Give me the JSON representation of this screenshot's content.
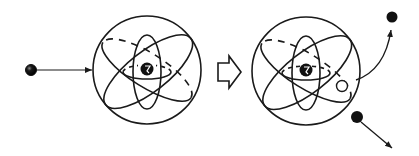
{
  "diagram": {
    "colors": {
      "ink": "#1a1a1a",
      "background": "#ffffff"
    },
    "stages": [
      {
        "id": "before",
        "elements": [
          "incident-particle",
          "incident-arrow",
          "atom-nucleus",
          "electron-orbits",
          "atom-boundary"
        ]
      },
      {
        "id": "transition",
        "elements": [
          "process-arrow"
        ]
      },
      {
        "id": "after",
        "elements": [
          "atom-nucleus",
          "electron-orbits",
          "atom-boundary",
          "electron-vacancy",
          "ejected-electron",
          "ejected-arrow",
          "scattered-particle",
          "scattered-arrow"
        ]
      }
    ],
    "labels": []
  }
}
